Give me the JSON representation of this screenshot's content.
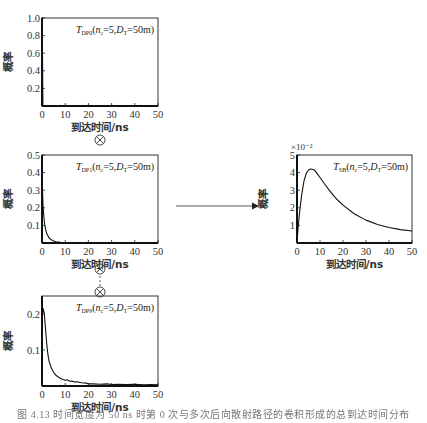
{
  "figure": {
    "caption": "图 4.13  时间宽度为 50 ns 时第 0 次与多次后向散射路径的卷积形成的总到达时间分布",
    "operator_symbol": "⊗",
    "ellipsis_symbol": "⋮",
    "arrow": "right-arrow"
  },
  "chart_data": [
    {
      "id": "dp0",
      "type": "line",
      "annotation": {
        "base": "T",
        "sub": "DP0",
        "params": "(n",
        "nsub": "c",
        "mid": "=5,D",
        "dsub": "T",
        "end": "=50m)"
      },
      "xlabel": "到达时间/ns",
      "ylabel": "概率",
      "xlim": [
        0,
        50
      ],
      "ylim": [
        0,
        1.0
      ],
      "xticks": [
        0,
        10,
        20,
        30,
        40,
        50
      ],
      "yticks": [
        0.2,
        0.4,
        0.6,
        0.8,
        1.0
      ],
      "ytick_labels": [
        "0.2",
        "0.4",
        "0.6",
        "0.8",
        "1.0"
      ],
      "grid": false,
      "x": [
        0,
        0,
        0.3,
        50
      ],
      "y": [
        0,
        1.0,
        0,
        0
      ],
      "note": "delta impulse at t=0"
    },
    {
      "id": "dp1",
      "type": "line",
      "annotation": {
        "base": "T",
        "sub": "DP1",
        "params": "(n",
        "nsub": "c",
        "mid": "=5,D",
        "dsub": "T",
        "end": "=50m)"
      },
      "xlabel": "到达时间/ns",
      "ylabel": "概率",
      "xlim": [
        0,
        50
      ],
      "ylim": [
        0,
        0.5
      ],
      "xticks": [
        0,
        10,
        20,
        30,
        40,
        50
      ],
      "yticks": [
        0.1,
        0.2,
        0.3,
        0.4,
        0.5
      ],
      "ytick_labels": [
        "0.1",
        "0.2",
        "0.3",
        "0.4",
        "0.5"
      ],
      "grid": false,
      "x": [
        0,
        0.2,
        0.5,
        1,
        1.5,
        2,
        3,
        4,
        5,
        6,
        8,
        10,
        15,
        20,
        30,
        40,
        50
      ],
      "y": [
        0.38,
        0.3,
        0.2,
        0.12,
        0.08,
        0.055,
        0.03,
        0.018,
        0.011,
        0.007,
        0.004,
        0.002,
        0.001,
        0.0005,
        0.0003,
        0.0002,
        0.0001
      ]
    },
    {
      "id": "dp9",
      "type": "line",
      "annotation": {
        "base": "T",
        "sub": "DP9",
        "params": "(n",
        "nsub": "c",
        "mid": "=5,D",
        "dsub": "T",
        "end": "=50m)"
      },
      "xlabel": "到达时间/ns",
      "ylabel": "概率",
      "xlim": [
        0,
        50
      ],
      "ylim": [
        0,
        0.25
      ],
      "xticks": [
        0,
        10,
        20,
        30,
        40,
        50
      ],
      "yticks": [
        0.1,
        0.2
      ],
      "ytick_labels": [
        "0.1",
        "0.2"
      ],
      "grid": false,
      "x": [
        0,
        0.5,
        1,
        1.5,
        2,
        2.5,
        3,
        4,
        5,
        6,
        7,
        8,
        9,
        10,
        11,
        12,
        13,
        14,
        15,
        17,
        19,
        20,
        22,
        25,
        28,
        30,
        33,
        36,
        40,
        44,
        47,
        50
      ],
      "y": [
        0.19,
        0.215,
        0.2,
        0.16,
        0.12,
        0.09,
        0.07,
        0.05,
        0.038,
        0.03,
        0.025,
        0.021,
        0.018,
        0.016,
        0.017,
        0.013,
        0.014,
        0.011,
        0.012,
        0.009,
        0.008,
        0.006,
        0.006,
        0.005,
        0.006,
        0.004,
        0.005,
        0.004,
        0.005,
        0.003,
        0.004,
        0.003
      ]
    },
    {
      "id": "sb",
      "type": "line",
      "annotation": {
        "base": "T",
        "sub": "SB",
        "params": "(n",
        "nsub": "c",
        "mid": "=5,D",
        "dsub": "T",
        "end": "=50m)"
      },
      "xlabel": "到达时间/ns",
      "ylabel": "概率",
      "y_multiplier": "×10⁻²",
      "xlim": [
        0,
        50
      ],
      "ylim": [
        0,
        5
      ],
      "xticks": [
        0,
        10,
        20,
        30,
        40,
        50
      ],
      "yticks": [
        1,
        2,
        3,
        4,
        5
      ],
      "ytick_labels": [
        "1",
        "2",
        "3",
        "4",
        "5"
      ],
      "grid": false,
      "x": [
        0,
        0.5,
        1,
        2,
        3,
        4,
        5,
        6,
        7,
        8,
        9,
        10,
        12,
        14,
        16,
        18,
        20,
        25,
        30,
        35,
        40,
        45,
        50
      ],
      "y": [
        0.0,
        0.9,
        1.6,
        2.7,
        3.5,
        3.95,
        4.15,
        4.2,
        4.18,
        4.08,
        3.9,
        3.72,
        3.35,
        3.0,
        2.68,
        2.4,
        2.15,
        1.65,
        1.3,
        1.05,
        0.88,
        0.76,
        0.68
      ]
    }
  ],
  "layout": {
    "panels": {
      "dp0": {
        "left": 42,
        "top": 18,
        "width": 116,
        "height": 88
      },
      "dp1": {
        "left": 42,
        "top": 155,
        "width": 116,
        "height": 88
      },
      "dp9": {
        "left": 42,
        "top": 296,
        "width": 116,
        "height": 90
      },
      "sb": {
        "left": 297,
        "top": 155,
        "width": 115,
        "height": 88
      }
    }
  }
}
